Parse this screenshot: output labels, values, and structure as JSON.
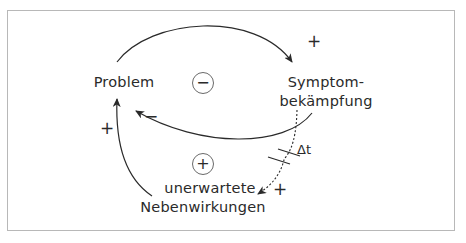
{
  "diagram": {
    "type": "causal-loop",
    "nodes": {
      "problem": "Problem",
      "symptom_line1": "Symptom-",
      "symptom_line2": "bekämpfung",
      "side_effects_line1": "unerwartete",
      "side_effects_line2": "Nebenwirkungen"
    },
    "loops": {
      "balancing": "−",
      "reinforcing": "+"
    },
    "links": [
      {
        "from": "Problem",
        "to": "Symptombekämpfung",
        "polarity": "+"
      },
      {
        "from": "Symptombekämpfung",
        "to": "Problem",
        "polarity": "−"
      },
      {
        "from": "Symptombekämpfung",
        "to": "unerwartete Nebenwirkungen",
        "polarity": "+",
        "delay": true
      },
      {
        "from": "unerwartete Nebenwirkungen",
        "to": "Problem",
        "polarity": "+"
      }
    ],
    "delay_label": "Δt",
    "colors": {
      "line": "#2a2a2a",
      "frame": "#b8b8b8",
      "background": "#ffffff"
    }
  }
}
